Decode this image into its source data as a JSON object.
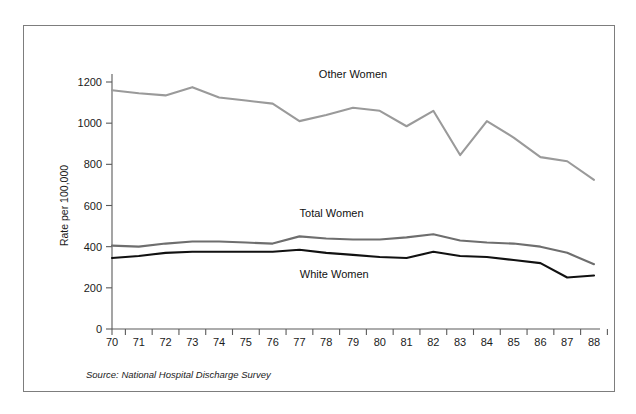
{
  "figure": {
    "source_note": "Source: National Hospital Discharge Survey"
  },
  "chart_data": {
    "type": "line",
    "title": "",
    "xlabel": "",
    "ylabel": "Rate per 100,000",
    "xlim": [
      70,
      88
    ],
    "ylim": [
      0,
      1200
    ],
    "grid": false,
    "legend_position": "inline-annotations",
    "x": [
      70,
      71,
      72,
      73,
      74,
      75,
      76,
      77,
      78,
      79,
      80,
      81,
      82,
      83,
      84,
      85,
      86,
      87,
      88
    ],
    "xtick_labels": [
      "70",
      "71",
      "72",
      "73",
      "74",
      "75",
      "76",
      "77",
      "78",
      "79",
      "80",
      "81",
      "82",
      "83",
      "84",
      "85",
      "86",
      "87",
      "88"
    ],
    "ytick_labels": [
      "0",
      "200",
      "400",
      "600",
      "800",
      "1000",
      "1200"
    ],
    "yticks": [
      0,
      200,
      400,
      600,
      800,
      1000,
      1200
    ],
    "series": [
      {
        "name": "Other Women",
        "color": "#9a9a9a",
        "values": [
          1160,
          1145,
          1135,
          1175,
          1125,
          1110,
          1095,
          1010,
          1040,
          1075,
          1060,
          985,
          1060,
          845,
          1010,
          930,
          835,
          815,
          725
        ],
        "label_x": 79,
        "label_y": 1220
      },
      {
        "name": "Total Women",
        "color": "#6e6e6e",
        "values": [
          405,
          400,
          415,
          425,
          425,
          420,
          415,
          450,
          440,
          435,
          435,
          445,
          460,
          430,
          420,
          415,
          400,
          370,
          315
        ],
        "label_x": 78.2,
        "label_y": 545
      },
      {
        "name": "White Women",
        "color": "#111111",
        "values": [
          345,
          355,
          370,
          375,
          375,
          375,
          375,
          385,
          370,
          360,
          350,
          345,
          375,
          355,
          350,
          335,
          320,
          250,
          260
        ],
        "label_x": 78.3,
        "label_y": 250
      }
    ]
  }
}
